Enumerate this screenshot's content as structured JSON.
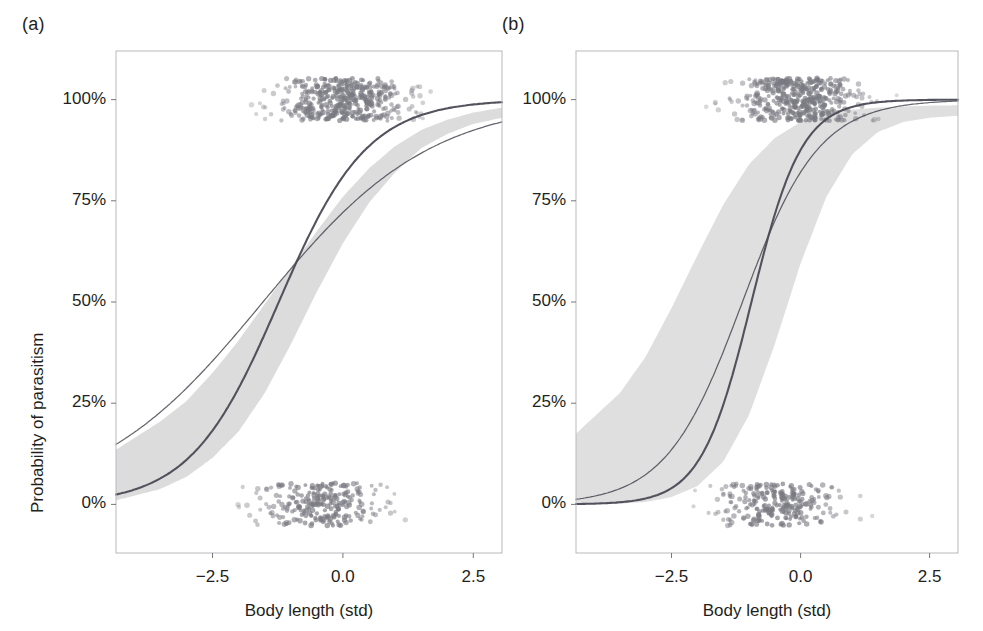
{
  "figure": {
    "background": "#ffffff",
    "text_color": "#231f20",
    "panels": [
      {
        "id": "a",
        "label": "(a)",
        "xlabel": "Body length (std)",
        "ylabel": "Probability of parasitism"
      },
      {
        "id": "b",
        "label": "(b)",
        "xlabel": "Body length (std)",
        "ylabel": "Probability of parasitism"
      }
    ]
  },
  "chart_data": [
    {
      "type": "line",
      "panel": "a",
      "title": "(a)",
      "xlabel": "Body length (std)",
      "ylabel": "Probability of parasitism",
      "xlim": [
        -4.35,
        3.05
      ],
      "ylim": [
        -0.12,
        1.12
      ],
      "xticks": [
        -2.5,
        0.0,
        2.5
      ],
      "xtick_labels": [
        "−2.5",
        "0.0",
        "2.5"
      ],
      "yticks": [
        0,
        0.25,
        0.5,
        0.75,
        1.0
      ],
      "ytick_labels": [
        "0%",
        "25%",
        "50%",
        "75%",
        "100%"
      ],
      "grid": false,
      "legend": "none",
      "curve_color": "#4a4a55",
      "band_color": "#d9d9d9",
      "point_color": "#7a7a82",
      "series": [
        {
          "name": "fitted-logistic-primary",
          "style": "solid-thick",
          "description": "Steeper fitted logistic curve with shaded 95% confidence band",
          "logistic": {
            "intercept": 1.45,
            "slope": 1.18
          },
          "x": [
            -4.35,
            -3.5,
            -3.0,
            -2.5,
            -2.0,
            -1.5,
            -1.0,
            -0.5,
            0.0,
            0.5,
            1.0,
            1.5,
            2.0,
            2.5,
            3.05
          ],
          "y": [
            0.045,
            0.1,
            0.15,
            0.21,
            0.29,
            0.39,
            0.5,
            0.61,
            0.71,
            0.79,
            0.86,
            0.91,
            0.94,
            0.96,
            0.975
          ]
        },
        {
          "name": "fitted-logistic-secondary",
          "style": "solid-thin",
          "description": "Shallower fitted logistic curve, no band",
          "logistic": {
            "intercept": 0.95,
            "slope": 0.62
          },
          "x": [
            -4.35,
            -3.5,
            -3.0,
            -2.5,
            -2.0,
            -1.5,
            -1.0,
            -0.5,
            0.0,
            0.5,
            1.0,
            1.5,
            2.0,
            2.5,
            3.05
          ],
          "y": [
            0.175,
            0.24,
            0.29,
            0.34,
            0.4,
            0.46,
            0.53,
            0.59,
            0.65,
            0.71,
            0.76,
            0.8,
            0.84,
            0.865,
            0.885
          ]
        }
      ],
      "confidence_band": {
        "for_series": "fitted-logistic-primary",
        "level": "95%",
        "x": [
          -4.35,
          -3.5,
          -3.0,
          -2.5,
          -2.0,
          -1.5,
          -1.0,
          -0.5,
          0.0,
          0.5,
          1.0,
          1.5,
          2.0,
          2.5,
          3.05
        ],
        "upper": [
          0.135,
          0.205,
          0.255,
          0.325,
          0.405,
          0.495,
          0.585,
          0.675,
          0.76,
          0.83,
          0.885,
          0.925,
          0.95,
          0.968,
          0.98
        ],
        "lower": [
          0.01,
          0.038,
          0.068,
          0.115,
          0.18,
          0.275,
          0.395,
          0.525,
          0.645,
          0.745,
          0.82,
          0.88,
          0.915,
          0.94,
          0.955
        ]
      },
      "rug_points": {
        "top_label": "parasitised (y = 1, jittered)",
        "bottom_label": "not parasitised (y = 0, jittered)",
        "top_center_x": 0.0,
        "bottom_center_x": -0.4,
        "top_count": 430,
        "bottom_count": 250
      }
    },
    {
      "type": "line",
      "panel": "b",
      "title": "(b)",
      "xlabel": "Body length (std)",
      "ylabel": "Probability of parasitism",
      "xlim": [
        -4.35,
        3.05
      ],
      "ylim": [
        -0.12,
        1.12
      ],
      "xticks": [
        -2.5,
        0.0,
        2.5
      ],
      "xtick_labels": [
        "−2.5",
        "0.0",
        "2.5"
      ],
      "yticks": [
        0,
        0.25,
        0.5,
        0.75,
        1.0
      ],
      "ytick_labels": [
        "0%",
        "25%",
        "50%",
        "75%",
        "100%"
      ],
      "grid": false,
      "legend": "none",
      "curve_color": "#4a4a55",
      "band_color": "#dcdcdc",
      "point_color": "#7a7a82",
      "series": [
        {
          "name": "fitted-logistic-primary",
          "style": "solid-thick",
          "description": "Very steep fitted logistic curve with wide shaded 95% confidence band",
          "logistic": {
            "intercept": 1.95,
            "slope": 2.05
          },
          "x": [
            -4.35,
            -3.5,
            -3.0,
            -2.5,
            -2.0,
            -1.5,
            -1.0,
            -0.5,
            0.0,
            0.5,
            1.0,
            1.5,
            2.0,
            2.5,
            3.05
          ],
          "y": [
            0.012,
            0.035,
            0.068,
            0.125,
            0.225,
            0.375,
            0.555,
            0.72,
            0.845,
            0.92,
            0.96,
            0.98,
            0.99,
            0.995,
            0.998
          ]
        },
        {
          "name": "fitted-logistic-secondary",
          "style": "solid-thin",
          "description": "Slightly shallower fitted logistic curve",
          "logistic": {
            "intercept": 1.52,
            "slope": 1.35
          },
          "x": [
            -4.35,
            -3.5,
            -3.0,
            -2.5,
            -2.0,
            -1.5,
            -1.0,
            -0.5,
            0.0,
            0.5,
            1.0,
            1.5,
            2.0,
            2.5,
            3.05
          ],
          "y": [
            0.085,
            0.145,
            0.21,
            0.3,
            0.41,
            0.53,
            0.65,
            0.755,
            0.84,
            0.9,
            0.935,
            0.955,
            0.965,
            0.97,
            0.975
          ]
        }
      ],
      "confidence_band": {
        "for_series": "fitted-logistic-primary",
        "level": "95%",
        "x": [
          -4.35,
          -3.5,
          -3.0,
          -2.5,
          -2.0,
          -1.5,
          -1.0,
          -0.5,
          0.0,
          0.5,
          1.0,
          1.5,
          2.0,
          2.5,
          3.05
        ],
        "upper": [
          0.175,
          0.275,
          0.365,
          0.485,
          0.615,
          0.74,
          0.84,
          0.905,
          0.945,
          0.965,
          0.975,
          0.98,
          0.983,
          0.985,
          0.986
        ],
        "lower": [
          0.0,
          0.002,
          0.006,
          0.018,
          0.045,
          0.105,
          0.22,
          0.395,
          0.595,
          0.76,
          0.865,
          0.92,
          0.945,
          0.955,
          0.96
        ]
      },
      "rug_points": {
        "top_label": "parasitised (y = 1, jittered)",
        "bottom_label": "not parasitised (y = 0, jittered)",
        "top_center_x": 0.0,
        "bottom_center_x": -0.4,
        "top_count": 430,
        "bottom_count": 250
      }
    }
  ]
}
